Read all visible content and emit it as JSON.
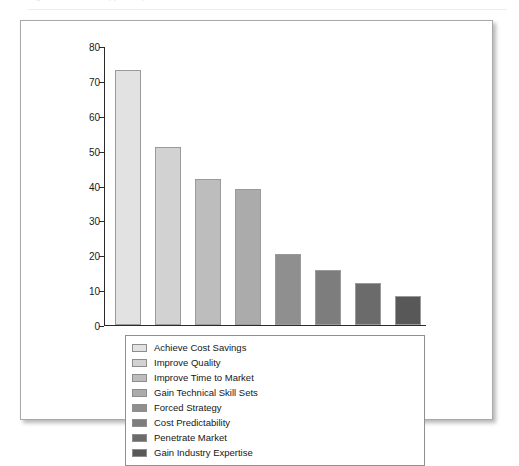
{
  "top_strip": {
    "ghost_text": "Figure — faded cropped caption line"
  },
  "chart_data": {
    "type": "bar",
    "title": "",
    "xlabel": "",
    "ylabel": "",
    "ylim": [
      0,
      80
    ],
    "ytick_step": 10,
    "yticks": [
      "0",
      "10",
      "20",
      "30",
      "40",
      "50",
      "60",
      "70",
      "80"
    ],
    "grid": false,
    "legend_position": "bottom",
    "xtick_labels_shown": false,
    "categories": [
      "Achieve Cost Savings",
      "Improve Quality",
      "Improve Time to Market",
      "Gain Technical Skill Sets",
      "Forced Strategy",
      "Cost Predictability",
      "Penetrate Market",
      "Gain Industry Expertise"
    ],
    "values": [
      73,
      51,
      42,
      39,
      20.5,
      15.8,
      12,
      8.3
    ],
    "colors": [
      "#e2e2e2",
      "#d2d2d2",
      "#bdbdbd",
      "#ababab",
      "#8f8f8f",
      "#7d7d7d",
      "#6b6b6b",
      "#585858"
    ]
  },
  "legend": {
    "column_left": [
      {
        "label": "Achieve Cost Savings",
        "color": "#e2e2e2"
      },
      {
        "label": "Improve Quality",
        "color": "#d2d2d2"
      },
      {
        "label": "Improve Time to Market",
        "color": "#bdbdbd"
      },
      {
        "label": "Gain Technical Skill Sets",
        "color": "#ababab"
      }
    ],
    "column_right": [
      {
        "label": "Forced Strategy",
        "color": "#8f8f8f"
      },
      {
        "label": "Cost Predictability",
        "color": "#7d7d7d"
      },
      {
        "label": "Penetrate Market",
        "color": "#6b6b6b"
      },
      {
        "label": "Gain Industry Expertise",
        "color": "#585858"
      }
    ]
  }
}
